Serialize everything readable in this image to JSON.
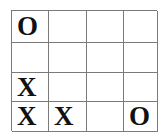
{
  "board": {
    "label": "tic-tac-toe-style 4x4 grid",
    "rows": 4,
    "columns": 4,
    "line_color": "#7a7a7a",
    "mark_color": "#111111",
    "background_color": "#ffffff",
    "cells": [
      [
        {
          "mark": "O"
        },
        {
          "mark": ""
        },
        {
          "mark": ""
        },
        {
          "mark": ""
        }
      ],
      [
        {
          "mark": ""
        },
        {
          "mark": ""
        },
        {
          "mark": ""
        },
        {
          "mark": ""
        }
      ],
      [
        {
          "mark": "X"
        },
        {
          "mark": ""
        },
        {
          "mark": ""
        },
        {
          "mark": ""
        }
      ],
      [
        {
          "mark": "X"
        },
        {
          "mark": "X"
        },
        {
          "mark": ""
        },
        {
          "mark": "O"
        }
      ]
    ]
  }
}
